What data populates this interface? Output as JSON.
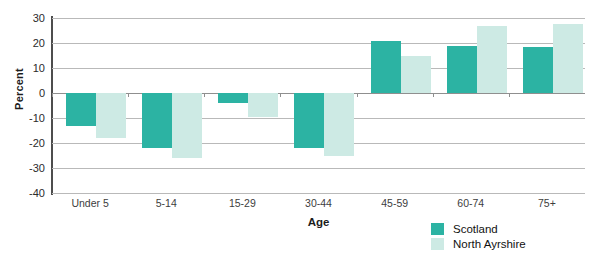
{
  "chart_data": {
    "type": "bar",
    "title": "",
    "xlabel": "Age",
    "ylabel": "Percent",
    "categories": [
      "Under 5",
      "5-14",
      "15-29",
      "30-44",
      "45-59",
      "60-74",
      "75+"
    ],
    "series": [
      {
        "name": "Scotland",
        "color": "#2cb3a3",
        "values": [
          -13,
          -22,
          -4,
          -22,
          21,
          19,
          18.5
        ]
      },
      {
        "name": "North Ayrshire",
        "color": "#cdeae4",
        "values": [
          -18,
          -26,
          -9.5,
          -25,
          15,
          27,
          27.5
        ]
      }
    ],
    "ylim": [
      -40,
      30
    ],
    "ytick_step": 10,
    "yticks": [
      "30",
      "20",
      "10",
      "0",
      "-10",
      "-20",
      "-30",
      "-40"
    ],
    "grid": true,
    "legend_position": "bottom-right"
  },
  "legend": {
    "items": [
      {
        "label": "Scotland"
      },
      {
        "label": "North Ayrshire"
      }
    ]
  }
}
